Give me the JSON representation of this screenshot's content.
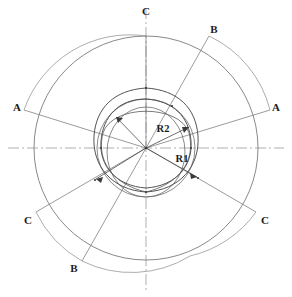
{
  "drawing": {
    "title": "Reuleaux rotor section construction",
    "type": "engineering-geometry",
    "canvas": {
      "width": 292,
      "height": 297
    },
    "center": {
      "x": 146,
      "y": 148
    },
    "colors": {
      "line": "#555555",
      "line_dark": "#3a3a3a",
      "centerline": "#888888",
      "text": "#1a1a1a",
      "background": "#ffffff"
    },
    "geometry": {
      "outer_circle_radius": 112,
      "mid_circle_radius": 66,
      "inner_circle_radius": 46,
      "reuleaux_outer_vertex_radius": 60,
      "reuleaux_inner_vertex_radius": 50,
      "dimension_r1_radius": 58,
      "dimension_r2_radius": 48
    },
    "centerlines": {
      "horizontal": {
        "y": 148,
        "style": "dash-dot"
      },
      "vertical": {
        "x": 146,
        "style": "dash-dot"
      }
    }
  },
  "section_lines": [
    {
      "id": "A-A",
      "label": "A",
      "angle_deg": 195
    },
    {
      "id": "A-A",
      "label": "A",
      "angle_deg": 15
    },
    {
      "id": "B-B",
      "label": "B",
      "angle_deg": -55
    },
    {
      "id": "B-B",
      "label": "B",
      "angle_deg": 125
    },
    {
      "id": "C-C",
      "label": "C",
      "angle_deg": 235
    },
    {
      "id": "C-C",
      "label": "C",
      "angle_deg": 305
    }
  ],
  "labels": [
    {
      "name": "label-c-top",
      "text": "C",
      "x": 146,
      "y": 11
    },
    {
      "name": "label-b-top-right",
      "text": "B",
      "x": 214,
      "y": 29
    },
    {
      "name": "label-a-left",
      "text": "A",
      "x": 17,
      "y": 107
    },
    {
      "name": "label-a-right",
      "text": "A",
      "x": 276,
      "y": 107
    },
    {
      "name": "label-r2",
      "text": "R2",
      "x": 163,
      "y": 129
    },
    {
      "name": "label-r1",
      "text": "R1",
      "x": 182,
      "y": 159
    },
    {
      "name": "label-c-bottom-left",
      "text": "C",
      "x": 28,
      "y": 220
    },
    {
      "name": "label-c-bottom-right",
      "text": "C",
      "x": 265,
      "y": 220
    },
    {
      "name": "label-b-bottom-left",
      "text": "B",
      "x": 74,
      "y": 268
    }
  ]
}
